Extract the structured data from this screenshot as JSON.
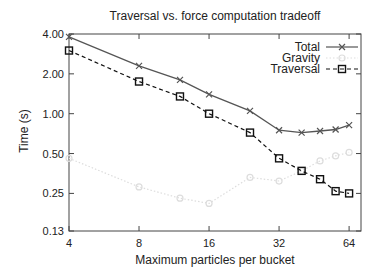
{
  "chart_data": {
    "type": "line",
    "title": "Traversal vs. force computation tradeoff",
    "xlabel": "Maximum particles per bucket",
    "ylabel": "Time (s)",
    "xscale": "log2",
    "yscale": "log",
    "xlim": [
      4,
      72
    ],
    "ylim": [
      0.13,
      4.0
    ],
    "xticks": [
      4,
      8,
      16,
      32,
      64
    ],
    "xtick_labels": [
      "4",
      "8",
      "16",
      "32",
      "64"
    ],
    "yticks": [
      0.13,
      0.25,
      0.5,
      1.0,
      2.0,
      4.0
    ],
    "ytick_labels": [
      "0.13",
      "0.25",
      "0.50",
      "1.00",
      "2.00",
      "4.00"
    ],
    "grid": false,
    "legend_position": "top-right",
    "x": [
      4,
      8,
      12,
      16,
      24,
      32,
      40,
      48,
      56,
      64
    ],
    "series": [
      {
        "name": "Total",
        "marker": "x",
        "line": "solid",
        "color": "#555555",
        "values": [
          3.8,
          2.3,
          1.8,
          1.4,
          1.05,
          0.75,
          0.72,
          0.74,
          0.76,
          0.82
        ]
      },
      {
        "name": "Gravity",
        "marker": "circle",
        "line": "dotted",
        "color": "#dddddd",
        "values": [
          0.46,
          0.28,
          0.23,
          0.21,
          0.33,
          0.31,
          0.37,
          0.44,
          0.48,
          0.51
        ]
      },
      {
        "name": "Traversal",
        "marker": "square",
        "line": "dashed",
        "color": "#111111",
        "values": [
          3.0,
          1.75,
          1.35,
          1.0,
          0.72,
          0.46,
          0.37,
          0.32,
          0.26,
          0.25
        ]
      }
    ]
  }
}
